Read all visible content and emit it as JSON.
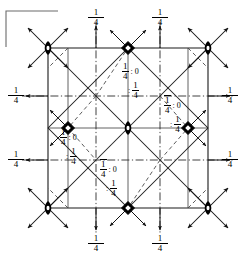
{
  "figure": {
    "type": "crystallographic-space-group-symmetry-diagram",
    "title": "",
    "cell": {
      "left": 48,
      "top": 48,
      "right": 208,
      "bottom": 208
    },
    "origin_marker": "corner-bracket-top-left"
  },
  "edge_labels": [
    {
      "id": "top-left-quarter",
      "text": "1/4",
      "num": "1",
      "den": "4",
      "x": 96,
      "y": 12,
      "arrow": "up"
    },
    {
      "id": "top-right-quarter",
      "text": "1/4",
      "num": "1",
      "den": "4",
      "x": 160,
      "y": 12,
      "arrow": "up"
    },
    {
      "id": "bottom-left-quarter",
      "text": "1/4",
      "num": "1",
      "den": "4",
      "x": 96,
      "y": 238,
      "arrow": "down"
    },
    {
      "id": "bottom-right-quarter",
      "text": "1/4",
      "num": "1",
      "den": "4",
      "x": 160,
      "y": 238,
      "arrow": "down"
    },
    {
      "id": "left-upper-quarter",
      "text": "1/4",
      "num": "1",
      "den": "4",
      "x": 14,
      "y": 92,
      "arrow": "left"
    },
    {
      "id": "left-lower-quarter",
      "text": "1/4",
      "num": "1",
      "den": "4",
      "x": 14,
      "y": 156,
      "arrow": "left"
    },
    {
      "id": "right-upper-quarter",
      "text": "1/4",
      "num": "1",
      "den": "4",
      "x": 226,
      "y": 92,
      "arrow": "right"
    },
    {
      "id": "right-lower-quarter",
      "text": "1/4",
      "num": "1",
      "den": "4",
      "x": 226,
      "y": 156,
      "arrow": "right"
    }
  ],
  "site_labels": [
    {
      "id": "site-upper-centre",
      "x": 122,
      "y": 64,
      "top_left_num": "1",
      "top_left_den": "4",
      "top_left_bar": false,
      "top_right": "0",
      "bottom_left_num": "",
      "bottom_left_den": "",
      "bottom_right_num": "1",
      "bottom_right_den": "4"
    },
    {
      "id": "site-right-centre",
      "x": 164,
      "y": 98,
      "top_left_num": "1",
      "top_left_den": "4",
      "top_left_bar": true,
      "top_right": "0",
      "bottom_left_num": "",
      "bottom_left_den": "",
      "bottom_right_num": "1",
      "bottom_right_den": "4"
    },
    {
      "id": "site-left-centre",
      "x": 60,
      "y": 130,
      "top_left_num": "1",
      "top_left_den": "4",
      "top_left_bar": false,
      "top_right": "0",
      "bottom_left_num": "",
      "bottom_left_den": "",
      "bottom_right_num": "1",
      "bottom_right_den": "4"
    },
    {
      "id": "site-lower-centre",
      "x": 100,
      "y": 162,
      "top_left_num": "1",
      "top_left_den": "4",
      "top_left_bar": true,
      "top_right": "0",
      "bottom_left_num": "",
      "bottom_left_den": "",
      "bottom_right_num": "1",
      "bottom_right_den": "4"
    }
  ],
  "symbols": {
    "twofold_lens": [
      {
        "id": "lens-top-left",
        "x": 48,
        "y": 48
      },
      {
        "id": "lens-top-right",
        "x": 208,
        "y": 48
      },
      {
        "id": "lens-bottom-left",
        "x": 48,
        "y": 208
      },
      {
        "id": "lens-bottom-right",
        "x": 208,
        "y": 208
      },
      {
        "id": "lens-centre",
        "x": 128,
        "y": 128
      }
    ],
    "fourbar_diamond": [
      {
        "id": "diamond-top-mid",
        "x": 128,
        "y": 48
      },
      {
        "id": "diamond-bottom-mid",
        "x": 128,
        "y": 208
      },
      {
        "id": "diamond-left-mid",
        "x": 68,
        "y": 128
      },
      {
        "id": "diamond-right-mid",
        "x": 188,
        "y": 128
      }
    ]
  },
  "colors": {
    "line": "#1a1a1a",
    "background": "#ffffff",
    "symbol_fill": "#000000"
  }
}
